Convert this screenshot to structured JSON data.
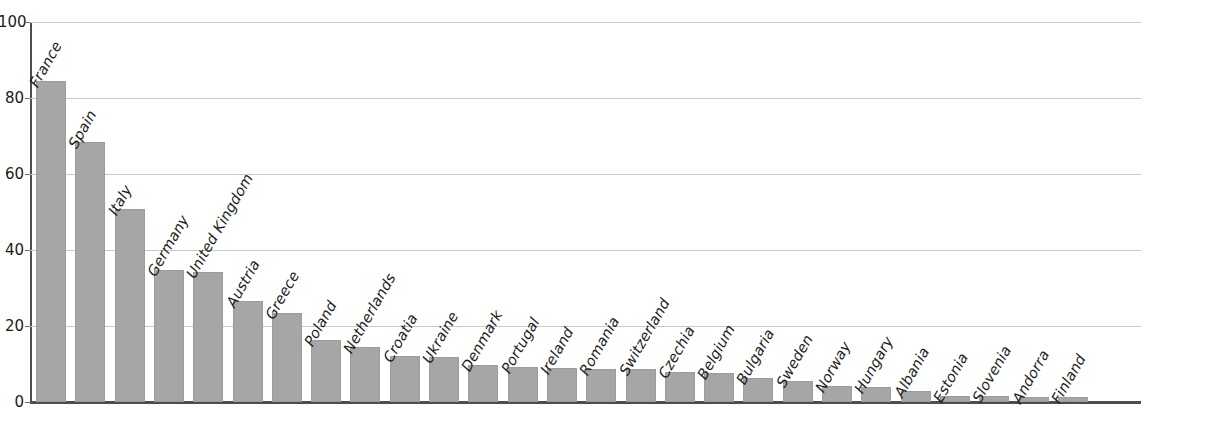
{
  "chart_data": {
    "type": "bar",
    "title": "",
    "xlabel": "",
    "ylabel": "",
    "ylim": [
      0,
      100
    ],
    "yticks": [
      0,
      20,
      40,
      60,
      80,
      100
    ],
    "grid": "horizontal",
    "legend": "none",
    "bar_color": "#a6a6a6",
    "axis_color": "#4d4d4d",
    "gridline_color": "#c9c9c9",
    "label_orientation": "rotated-60-above-bar",
    "categories": [
      "France",
      "Spain",
      "Italy",
      "Germany",
      "United Kingdom",
      "Austria",
      "Greece",
      "Poland",
      "Netherlands",
      "Croatia",
      "Ukraine",
      "Denmark",
      "Portugal",
      "Ireland",
      "Romania",
      "Switzerland",
      "Czechia",
      "Belgium",
      "Bulgaria",
      "Sweden",
      "Norway",
      "Hungary",
      "Albania",
      "Estonia",
      "Slovenia",
      "Andorra",
      "Finland"
    ],
    "values": [
      84.5,
      68.3,
      50.8,
      34.8,
      34.3,
      26.5,
      23.5,
      16.4,
      14.5,
      12.2,
      11.8,
      9.8,
      9.3,
      9.0,
      8.7,
      8.6,
      8.0,
      7.7,
      6.4,
      5.6,
      4.3,
      4.0,
      2.9,
      1.7,
      1.5,
      1.4,
      1.2
    ]
  }
}
